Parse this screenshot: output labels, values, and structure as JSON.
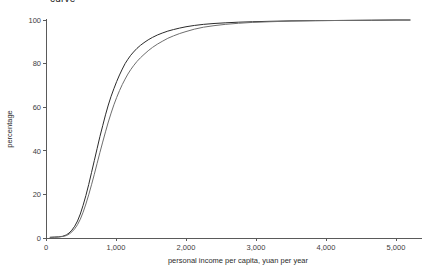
{
  "chart_data": {
    "type": "line",
    "title": "curve",
    "title_clipped": true,
    "xlabel": "personal income per capita, yuan per year",
    "ylabel": "percentage",
    "xlim": [
      0,
      5200
    ],
    "ylim": [
      0,
      100
    ],
    "xticks": [
      0,
      1000,
      2000,
      3000,
      4000,
      5000
    ],
    "xtick_labels": [
      "0",
      "1,000",
      "2,000",
      "3,000",
      "4,000",
      "5,000"
    ],
    "yticks": [
      0,
      20,
      40,
      60,
      80,
      100
    ],
    "ytick_labels": [
      "0",
      "20",
      "40",
      "60",
      "80",
      "100"
    ],
    "grid": false,
    "legend": "none",
    "series": [
      {
        "name": "series-dark",
        "color": "#2b2b2b",
        "x": [
          60,
          120,
          180,
          240,
          290,
          330,
          370,
          410,
          450,
          490,
          530,
          570,
          610,
          650,
          690,
          730,
          770,
          810,
          850,
          890,
          930,
          970,
          1010,
          1050,
          1090,
          1130,
          1170,
          1210,
          1250,
          1300,
          1350,
          1400,
          1460,
          1520,
          1590,
          1660,
          1740,
          1820,
          1910,
          2000,
          2120,
          2250,
          2400,
          2560,
          2750,
          2950,
          3200,
          3500,
          3850,
          4250,
          4650,
          5000,
          5200
        ],
        "y": [
          0.3,
          0.4,
          0.5,
          0.8,
          1.4,
          2.3,
          3.6,
          5.4,
          7.8,
          11.0,
          15.0,
          19.5,
          24.5,
          30.0,
          35.5,
          41.0,
          46.5,
          51.5,
          56.5,
          61.0,
          65.0,
          68.5,
          71.8,
          74.8,
          77.5,
          80.0,
          82.0,
          83.8,
          85.3,
          87.0,
          88.4,
          89.6,
          90.9,
          92.0,
          93.1,
          94.0,
          94.9,
          95.6,
          96.3,
          96.9,
          97.5,
          98.0,
          98.4,
          98.7,
          99.0,
          99.2,
          99.4,
          99.6,
          99.7,
          99.8,
          99.9,
          100.0,
          100.0
        ]
      },
      {
        "name": "series-gray",
        "color": "#6e6e6e",
        "x": [
          60,
          120,
          180,
          240,
          290,
          330,
          370,
          410,
          450,
          490,
          530,
          570,
          610,
          650,
          690,
          730,
          770,
          810,
          850,
          890,
          930,
          970,
          1010,
          1050,
          1090,
          1130,
          1170,
          1210,
          1250,
          1300,
          1350,
          1400,
          1460,
          1520,
          1590,
          1660,
          1740,
          1820,
          1910,
          2000,
          2120,
          2250,
          2400,
          2560,
          2750,
          2950,
          3200,
          3500,
          3850,
          4250,
          4650,
          5000,
          5200
        ],
        "y": [
          0.3,
          0.4,
          0.5,
          0.7,
          1.1,
          1.8,
          2.8,
          4.2,
          6.1,
          8.6,
          11.8,
          15.6,
          19.8,
          24.4,
          29.2,
          34.2,
          39.2,
          44.0,
          48.7,
          53.2,
          57.3,
          61.1,
          64.5,
          67.6,
          70.4,
          72.9,
          75.2,
          77.2,
          79.0,
          81.0,
          82.7,
          84.2,
          85.9,
          87.4,
          88.9,
          90.2,
          91.6,
          92.7,
          93.8,
          94.7,
          95.8,
          96.7,
          97.4,
          98.0,
          98.5,
          98.9,
          99.2,
          99.5,
          99.7,
          99.8,
          99.9,
          100.0,
          100.0
        ]
      }
    ]
  },
  "plot_geometry": {
    "left": 46,
    "right": 410,
    "top": 20,
    "bottom": 238
  },
  "colors": {
    "axis": "#5a5a5a",
    "text": "#2b2b2b",
    "background": "#ffffff"
  }
}
